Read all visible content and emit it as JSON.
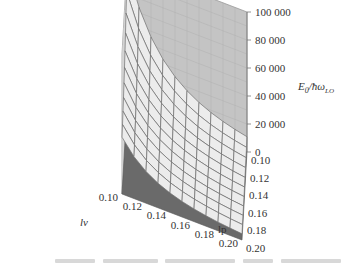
{
  "chart_data": {
    "type": "surface3d",
    "title": "",
    "x": {
      "label": "l_v",
      "label_display": "lv",
      "ticks": [
        0.1,
        0.12,
        0.14,
        0.16,
        0.18,
        0.2
      ],
      "tick_labels": [
        "0.10",
        "0.12",
        "0.14",
        "0.16",
        "0.18",
        "0.20"
      ],
      "range": [
        0.1,
        0.2
      ]
    },
    "y": {
      "label": "lp",
      "ticks": [
        0.1,
        0.12,
        0.14,
        0.16,
        0.18,
        0.2
      ],
      "tick_labels": [
        "0.10",
        "0.12",
        "0.14",
        "0.16",
        "0.18",
        "0.20"
      ],
      "range": [
        0.1,
        0.2
      ]
    },
    "z": {
      "label": "E0/ħωLO",
      "label_main": "E",
      "label_sub0": "0",
      "label_rest": "/ħω",
      "label_sub1": "LO",
      "ticks": [
        0,
        20000,
        40000,
        60000,
        80000,
        100000
      ],
      "tick_labels": [
        "0",
        "20 000",
        "40 000",
        "60 000",
        "80 000",
        "100 000"
      ],
      "range": [
        0,
        100000
      ]
    },
    "grid": true,
    "surface_grid_n": 11,
    "corner_values": {
      "lv0.10_lp0.10": 100000,
      "lv0.10_lp0.20": 40000,
      "lv0.20_lp0.10": 20000,
      "lv0.20_lp0.20": 5000
    },
    "colors": {
      "surface_fill": "#ececec",
      "surface_mesh": "#6e6e6e",
      "floor": "#6a6a6a",
      "right_wall": "#c4c4c4",
      "left_wall": "#ffffff",
      "wall_grid": "#cfcfcf",
      "frame": "#999999"
    }
  }
}
